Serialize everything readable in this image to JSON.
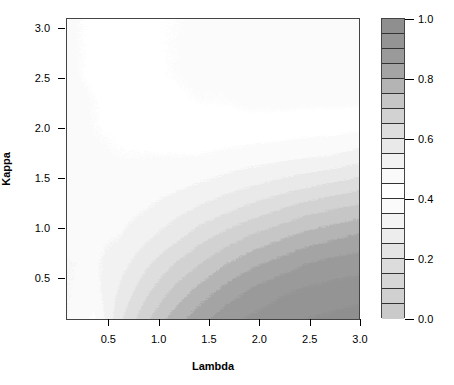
{
  "chart_data": {
    "type": "heatmap",
    "title": "",
    "xlabel": "Lambda",
    "ylabel": "Kappa",
    "xlim": [
      0.08,
      3.0
    ],
    "ylim": [
      0.08,
      3.1
    ],
    "xticks": [
      0.5,
      1.0,
      1.5,
      2.0,
      2.5,
      3.0
    ],
    "xticklabels": [
      "0.5",
      "1.0",
      "1.5",
      "2.0",
      "2.5",
      "3.0"
    ],
    "yticks": [
      0.5,
      1.0,
      1.5,
      2.0,
      2.5,
      3.0
    ],
    "yticklabels": [
      "0.5",
      "1.0",
      "1.5",
      "2.0",
      "2.5",
      "3.0"
    ],
    "grid": false,
    "legend_position": "right",
    "colorbar": {
      "label": "",
      "vmin": 0.0,
      "vmax": 1.0,
      "ticks": [
        0.0,
        0.2,
        0.4,
        0.6,
        0.8,
        1.0
      ],
      "ticklabels": [
        "0.0",
        "0.2",
        "0.4",
        "0.6",
        "0.8",
        "1.0"
      ],
      "n_bands": 20,
      "band_colors_top_to_bottom": [
        "#8f8f8f",
        "#949494",
        "#9a9a9a",
        "#a4a4a4",
        "#b4b4b4",
        "#c6c6c6",
        "#d2d2d2",
        "#dedede",
        "#e9e9e9",
        "#f2f2f2",
        "#fafafa",
        "#ffffff",
        "#fbfbfb",
        "#f4f4f4",
        "#ededed",
        "#e4e4e4",
        "#dcdcdc",
        "#d6d6d6",
        "#d0d0d0",
        "#cacaca"
      ]
    },
    "x": [
      0.08,
      0.35,
      0.62,
      0.89,
      1.16,
      1.43,
      1.7,
      1.97,
      2.24,
      2.51,
      2.78,
      3.0
    ],
    "y": [
      0.08,
      0.36,
      0.63,
      0.91,
      1.18,
      1.46,
      1.73,
      2.01,
      2.28,
      2.56,
      2.83,
      3.1
    ],
    "z_rows_top_to_bottom": [
      [
        0.46,
        0.44,
        0.42,
        0.41,
        0.4,
        0.39,
        0.38,
        0.38,
        0.37,
        0.37,
        0.36,
        0.36
      ],
      [
        0.46,
        0.44,
        0.42,
        0.41,
        0.4,
        0.39,
        0.38,
        0.38,
        0.37,
        0.37,
        0.36,
        0.36
      ],
      [
        0.46,
        0.44,
        0.43,
        0.41,
        0.4,
        0.39,
        0.39,
        0.38,
        0.38,
        0.37,
        0.37,
        0.37
      ],
      [
        0.47,
        0.45,
        0.43,
        0.42,
        0.41,
        0.4,
        0.4,
        0.39,
        0.39,
        0.39,
        0.39,
        0.39
      ],
      [
        0.47,
        0.45,
        0.44,
        0.43,
        0.42,
        0.42,
        0.42,
        0.42,
        0.42,
        0.43,
        0.43,
        0.44
      ],
      [
        0.48,
        0.46,
        0.45,
        0.45,
        0.45,
        0.45,
        0.46,
        0.47,
        0.48,
        0.49,
        0.5,
        0.52
      ],
      [
        0.48,
        0.47,
        0.47,
        0.47,
        0.48,
        0.5,
        0.52,
        0.54,
        0.56,
        0.58,
        0.6,
        0.62
      ],
      [
        0.49,
        0.48,
        0.48,
        0.5,
        0.53,
        0.56,
        0.59,
        0.62,
        0.65,
        0.68,
        0.7,
        0.72
      ],
      [
        0.49,
        0.49,
        0.5,
        0.54,
        0.58,
        0.63,
        0.67,
        0.71,
        0.74,
        0.77,
        0.79,
        0.81
      ],
      [
        0.5,
        0.49,
        0.53,
        0.59,
        0.65,
        0.7,
        0.75,
        0.79,
        0.82,
        0.85,
        0.87,
        0.88
      ],
      [
        0.5,
        0.48,
        0.56,
        0.64,
        0.71,
        0.77,
        0.82,
        0.86,
        0.89,
        0.91,
        0.92,
        0.93
      ],
      [
        0.5,
        0.44,
        0.59,
        0.69,
        0.77,
        0.83,
        0.88,
        0.91,
        0.93,
        0.95,
        0.96,
        0.97
      ]
    ]
  }
}
